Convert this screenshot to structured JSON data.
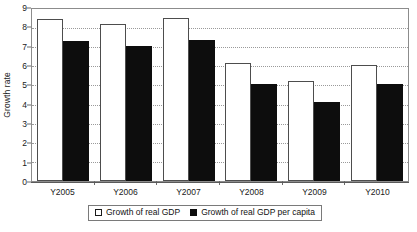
{
  "chart_data": {
    "type": "bar",
    "title": "",
    "xlabel": "",
    "ylabel": "Growth rate",
    "ylim": [
      0,
      9
    ],
    "ytick_step": 1,
    "yticks": [
      "0",
      "1",
      "2",
      "3",
      "4",
      "5",
      "6",
      "7",
      "8",
      "9"
    ],
    "grid": true,
    "grid_style": "dotted horizontal",
    "legend_position": "bottom-center",
    "categories": [
      "Y2005",
      "Y2006",
      "Y2007",
      "Y2008",
      "Y2009",
      "Y2010"
    ],
    "series": [
      {
        "name": "Growth of real GDP",
        "swatch": "hollow-square",
        "color": "#ffffff",
        "edge_color": "#4d4d4d",
        "values": [
          8.4,
          8.1,
          8.45,
          6.1,
          5.15,
          6.0
        ]
      },
      {
        "name": "Growth of real GDP per capita",
        "swatch": "filled-square",
        "color": "#0d0d0d",
        "edge_color": "#0d0d0d",
        "values": [
          7.25,
          7.0,
          7.3,
          5.0,
          4.1,
          5.0
        ]
      }
    ]
  },
  "legend": {
    "entries": [
      {
        "label": "Growth of real GDP"
      },
      {
        "label": "Growth of real GDP per capita"
      }
    ]
  },
  "axes": {
    "y_title": "Growth rate"
  }
}
